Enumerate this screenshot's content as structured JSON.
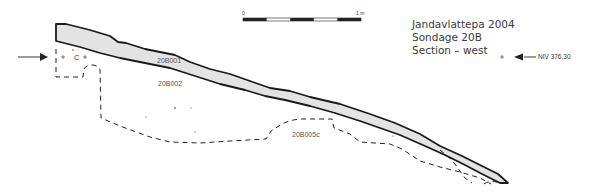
{
  "title": {
    "site": "Jandavlattepa  2004",
    "sondage": "Sondage 20B",
    "section": "Section – west"
  },
  "scale_bar": {
    "start_label": "0",
    "end_label": "1 m",
    "segments": 5
  },
  "level_marker": {
    "label": "NIV 376,30",
    "symbol": "+"
  },
  "layers": [
    {
      "id": "20B001",
      "label": "20B001",
      "fill": "#e3e3e3",
      "style": "solid"
    },
    {
      "id": "20B002",
      "label": "20B002",
      "style": "none"
    },
    {
      "id": "20B005c",
      "label": "20B005c",
      "style": "dashed"
    }
  ],
  "left_marker": {
    "label": "C",
    "symbol": "+"
  },
  "colors": {
    "line": "#1a1a1a",
    "layer_fill": "#e3e3e3",
    "text": "#3a3a3a"
  }
}
